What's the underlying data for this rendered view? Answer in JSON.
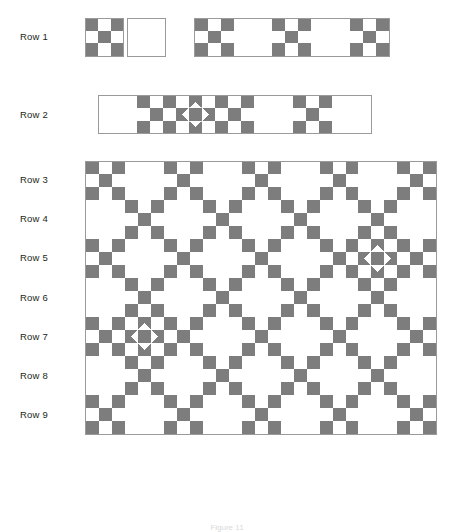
{
  "figure": {
    "caption": "Figure 11",
    "colors": {
      "fabric_dark": "#7d7d7d",
      "fabric_light": "#ffffff",
      "outline": "#9a9a9a",
      "label_text": "#231f20"
    },
    "block_size_px": 39.2,
    "grid_columns": 9,
    "grid_rows": 9
  },
  "labels": [
    {
      "id": "row-1",
      "text": "Row 1"
    },
    {
      "id": "row-2",
      "text": "Row 2"
    },
    {
      "id": "row-3",
      "text": "Row 3"
    },
    {
      "id": "row-4",
      "text": "Row 4"
    },
    {
      "id": "row-5",
      "text": "Row 5"
    },
    {
      "id": "row-6",
      "text": "Row 6"
    },
    {
      "id": "row-7",
      "text": "Row 7"
    },
    {
      "id": "row-8",
      "text": "Row 8"
    },
    {
      "id": "row-9",
      "text": "Row 9"
    }
  ],
  "block_types": {
    "N": "nine-patch-block",
    "P": "plain-white-block",
    "S": "star-block"
  },
  "rows": [
    {
      "label": "Row 1",
      "detached_blocks": [
        "N",
        "P"
      ],
      "strip_blocks": [
        "N",
        "P",
        "N",
        "P",
        "N"
      ]
    },
    {
      "label": "Row 2",
      "detached_blocks": [],
      "strip_blocks": [
        "P",
        "N",
        "S",
        "N",
        "P",
        "N",
        "P"
      ]
    },
    {
      "label": "Row 3",
      "blocks": [
        "N",
        "P",
        "N",
        "P",
        "N",
        "P",
        "N",
        "P",
        "N"
      ]
    },
    {
      "label": "Row 4",
      "blocks": [
        "P",
        "N",
        "P",
        "N",
        "P",
        "N",
        "P",
        "N",
        "P"
      ]
    },
    {
      "label": "Row 5",
      "blocks": [
        "N",
        "P",
        "N",
        "P",
        "N",
        "P",
        "N",
        "S",
        "N"
      ]
    },
    {
      "label": "Row 6",
      "blocks": [
        "P",
        "N",
        "P",
        "N",
        "P",
        "N",
        "P",
        "N",
        "P"
      ]
    },
    {
      "label": "Row 7",
      "blocks": [
        "N",
        "S",
        "N",
        "P",
        "N",
        "P",
        "N",
        "P",
        "N"
      ]
    },
    {
      "label": "Row 8",
      "blocks": [
        "P",
        "N",
        "P",
        "N",
        "P",
        "N",
        "P",
        "N",
        "P"
      ]
    },
    {
      "label": "Row 9",
      "blocks": [
        "N",
        "P",
        "N",
        "P",
        "N",
        "P",
        "N",
        "P",
        "N"
      ]
    }
  ],
  "nine_patch_layout": [
    [
      "dark",
      "light",
      "dark"
    ],
    [
      "light",
      "dark",
      "light"
    ],
    [
      "dark",
      "light",
      "dark"
    ]
  ],
  "star_layout": [
    [
      "light",
      "hourglass",
      "light"
    ],
    [
      "hourglass",
      "dark",
      "hourglass"
    ],
    [
      "light",
      "hourglass",
      "light"
    ]
  ]
}
